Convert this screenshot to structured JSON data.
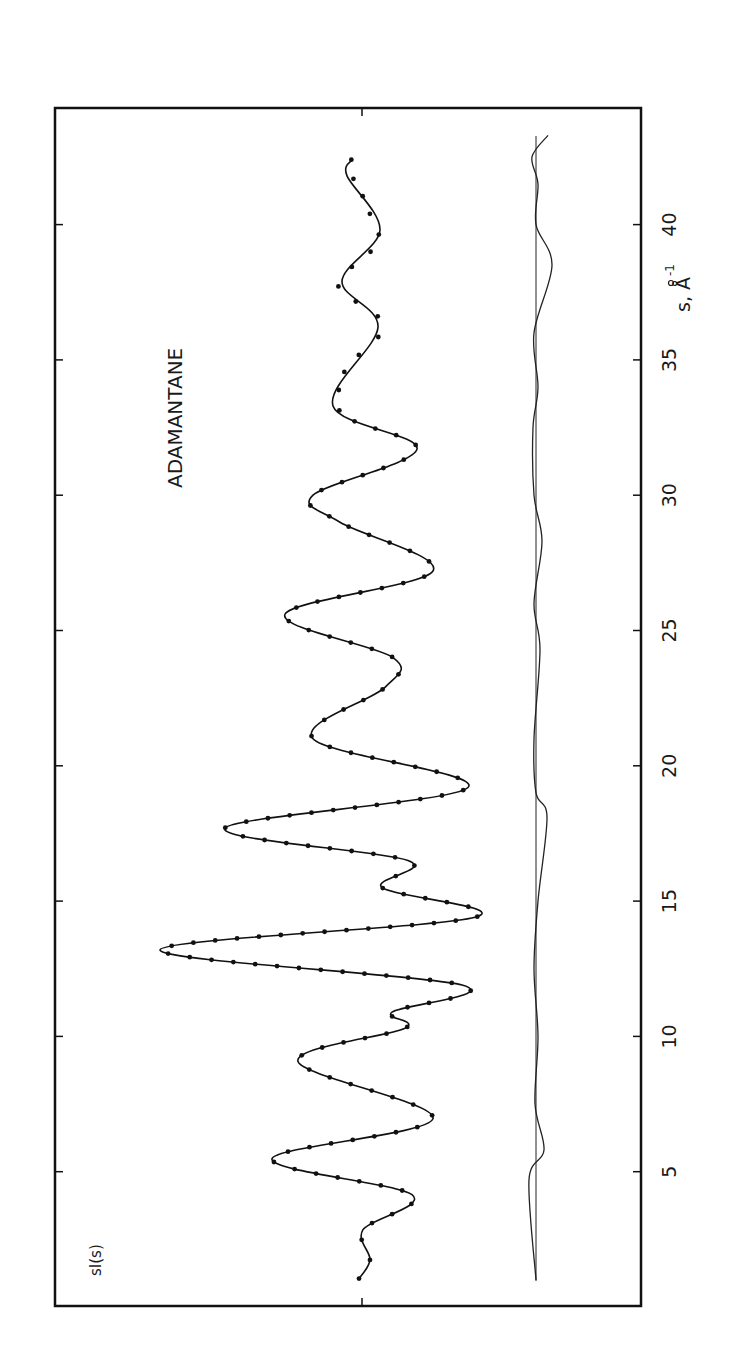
{
  "chart_data": {
    "type": "line",
    "title": "ADAMANTANE",
    "xlabel": "s, Å⁻¹",
    "ylabel": "sI(s)",
    "orientation": "rotated 90° counter-clockwise (s axis runs bottom→top, sI(s) positive to the left)",
    "xlim": [
      0,
      44.5
    ],
    "xticks": [
      5,
      10,
      15,
      20,
      25,
      30,
      35,
      40
    ],
    "y_units": "arbitrary (no tick labels)",
    "grid": false,
    "series": [
      {
        "name": "theoretical sI(s) (solid curve)",
        "style": "solid",
        "points": [
          [
            1.05,
            3
          ],
          [
            1.75,
            -8
          ],
          [
            2.86,
            -1
          ],
          [
            4.15,
            -50
          ],
          [
            5.48,
            90
          ],
          [
            6.96,
            -71
          ],
          [
            9.07,
            64
          ],
          [
            10.3,
            -43
          ],
          [
            10.9,
            -30
          ],
          [
            11.9,
            -100
          ],
          [
            13.2,
            202
          ],
          [
            14.4,
            -113
          ],
          [
            15.5,
            -20
          ],
          [
            16.5,
            -46
          ],
          [
            17.7,
            137
          ],
          [
            19.2,
            -106
          ],
          [
            21.0,
            49
          ],
          [
            22.9,
            -23
          ],
          [
            24.0,
            -31
          ],
          [
            25.6,
            77
          ],
          [
            27.2,
            -71
          ],
          [
            29.0,
            22
          ],
          [
            30.0,
            49
          ],
          [
            31.7,
            -55
          ],
          [
            33.3,
            29
          ],
          [
            36.2,
            -16
          ],
          [
            37.9,
            20
          ],
          [
            39.8,
            -18
          ],
          [
            41.8,
            15
          ],
          [
            42.4,
            10
          ]
        ]
      },
      {
        "name": "experimental sI(s) (dots)",
        "style": "markers",
        "points_follow": "theoretical curve",
        "deviation_region_s": [
          33,
          43
        ]
      },
      {
        "name": "difference curve (residual)",
        "style": "solid thin",
        "baseline_offset": -174,
        "points": [
          [
            1.0,
            0
          ],
          [
            4.7,
            7
          ],
          [
            5.8,
            -8
          ],
          [
            7.5,
            1
          ],
          [
            10,
            -2
          ],
          [
            12.5,
            2
          ],
          [
            15,
            -2
          ],
          [
            18.1,
            -11
          ],
          [
            19,
            0
          ],
          [
            21,
            2
          ],
          [
            24.3,
            -4
          ],
          [
            26,
            2
          ],
          [
            28.3,
            -6
          ],
          [
            30,
            2
          ],
          [
            32.5,
            3
          ],
          [
            34,
            -2
          ],
          [
            36,
            2
          ],
          [
            38.5,
            -16
          ],
          [
            40,
            0
          ],
          [
            41.5,
            -2
          ],
          [
            42.5,
            4
          ],
          [
            43.3,
            -12
          ]
        ]
      }
    ]
  },
  "labels": {
    "title": "ADAMANTANE",
    "y_axis": "sI(s)",
    "x_axis_s": "s,",
    "x_axis_unit": "Å",
    "x_axis_exp": "-1",
    "ticks": [
      "5",
      "10",
      "15",
      "20",
      "25",
      "30",
      "35",
      "40"
    ]
  }
}
